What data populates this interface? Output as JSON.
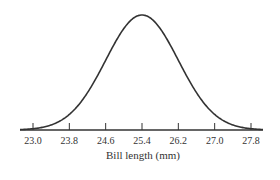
{
  "chart_data": {
    "type": "line",
    "title": "",
    "xlabel": "Bill length (mm)",
    "ylabel": "",
    "mean": 25.4,
    "sd": 0.8,
    "x_ticks": [
      "23.0",
      "23.8",
      "24.6",
      "25.4",
      "26.2",
      "27.0",
      "27.8"
    ],
    "xlim": [
      22.6,
      28.0
    ],
    "grid": false,
    "legend": null,
    "line_color": "#333333"
  }
}
